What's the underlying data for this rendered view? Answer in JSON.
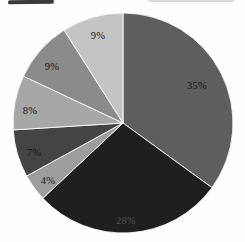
{
  "chart_data": {
    "type": "pie",
    "title": "",
    "legend": "none",
    "start_angle_deg": 0,
    "direction": "clockwise",
    "center": {
      "x": 123,
      "y": 123
    },
    "radius": 110,
    "labels": [
      "35%",
      "28%",
      "4%",
      "7%",
      "8%",
      "9%",
      "9%"
    ],
    "values": [
      35,
      28,
      4,
      7,
      8,
      9,
      9
    ],
    "colors": [
      "#5e5e5e",
      "#1f1f1f",
      "#9d9d9d",
      "#444444",
      "#a7a7a7",
      "#8b8b8b",
      "#c4c4c4"
    ],
    "label_colors": [
      "#161616",
      "#4f4f4f",
      "#161616",
      "#161616",
      "#161616",
      "#161616",
      "#161616"
    ],
    "label_positions": [
      {
        "x": 197,
        "y": 85
      },
      {
        "x": 126,
        "y": 220
      },
      {
        "x": 48,
        "y": 180
      },
      {
        "x": 34,
        "y": 152
      },
      {
        "x": 30,
        "y": 110
      },
      {
        "x": 52,
        "y": 66
      },
      {
        "x": 98,
        "y": 35
      }
    ]
  },
  "artifacts": {
    "top_left_smudge": {
      "x": 8,
      "y": 0,
      "width": 46,
      "height": 4,
      "color": "#3a3a3a"
    },
    "top_right_streak": {
      "x": 148,
      "y": 0,
      "width": 86,
      "height": 2,
      "color": "#c9c9c9"
    }
  }
}
